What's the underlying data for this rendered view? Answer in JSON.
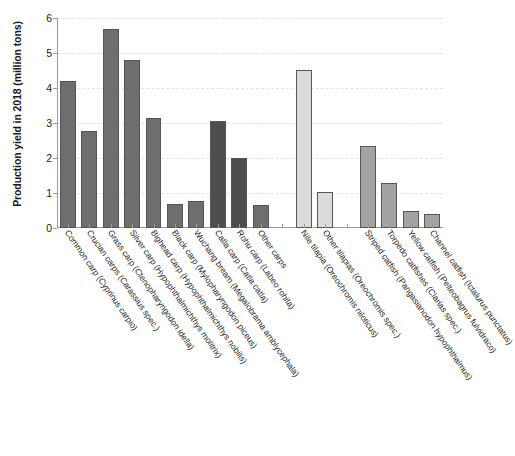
{
  "chart_data": {
    "type": "bar",
    "title": "",
    "xlabel": "",
    "ylabel": "Production yield in 2018 (million tons)",
    "ylim": [
      0,
      6
    ],
    "yticks": [
      0,
      1,
      2,
      3,
      4,
      5,
      6
    ],
    "ytick_labels": [
      "0",
      "1",
      "2",
      "3",
      "4",
      "5",
      "6"
    ],
    "grid": true,
    "grid_axis": "y",
    "legend": "none",
    "categories": [
      "Common carp (Cyprinus carpio)",
      "Crucian carps (Carassius spec.)",
      "Grass carp (Ctenopharyngodon idella)",
      "Silver carp (Hypophthalmichthys molitrix)",
      "Bighead carp (Hypophthalmichthys nobilis)",
      "Black carp (Mylopharyngodon piceus)",
      "Wuchang bream (Megalobrama amblycephala)",
      "Catla carp (Catla catla)",
      "Rohu carp (Labeo rohita)",
      "Other carps",
      "",
      "Nile tilapia (Oreochromis niloticus)",
      "Other tilapias (Oreochromis spec.)",
      "",
      "Striped catfish (Pangasianodon hypophthalmus)",
      "Torpedo catfishes (Clarias spec.)",
      "Yellow catfish (Pelteobagrus fulvidraco)",
      "Channel catfish (Ictalurus punctatus)"
    ],
    "values": [
      4.2,
      2.78,
      5.7,
      4.8,
      3.15,
      0.68,
      0.78,
      3.05,
      2.0,
      0.65,
      null,
      4.52,
      1.02,
      null,
      2.35,
      1.28,
      0.5,
      0.4
    ],
    "bar_colors": [
      "#6e6e6e",
      "#6e6e6e",
      "#6e6e6e",
      "#6e6e6e",
      "#6e6e6e",
      "#6e6e6e",
      "#6e6e6e",
      "#4d4d4d",
      "#4d4d4d",
      "#6e6e6e",
      null,
      "#dcdcdc",
      "#dcdcdc",
      null,
      "#a3a3a3",
      "#a3a3a3",
      "#a3a3a3",
      "#a3a3a3"
    ],
    "bar_edge_color": "#555558",
    "grid_color": "#e2e2e6",
    "axis_color": "#9a9a9a",
    "text_color": "#1a1a1a",
    "background": "#ffffff"
  }
}
